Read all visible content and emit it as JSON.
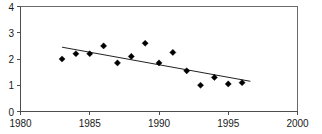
{
  "chart_data": {
    "type": "scatter",
    "title": "",
    "subtitle": "",
    "xlabel": "",
    "ylabel": "",
    "xlim": [
      1980,
      2000
    ],
    "ylim": [
      0,
      4
    ],
    "grid": false,
    "legend": null,
    "x_ticks": [
      1980,
      1985,
      1990,
      1995,
      2000
    ],
    "x_tick_labels": [
      "1980",
      "1985",
      "1990",
      "1995",
      "2000"
    ],
    "y_ticks": [
      0,
      1,
      2,
      3,
      4
    ],
    "y_tick_labels": [
      "0",
      "1",
      "2",
      "3",
      "4"
    ],
    "marker": "diamond",
    "marker_color": "#000000",
    "series": [
      {
        "name": "observations",
        "x": [
          1983,
          1984,
          1985,
          1986,
          1987,
          1988,
          1989,
          1990,
          1991,
          1992,
          1993,
          1994,
          1995,
          1996
        ],
        "values": [
          2.0,
          2.2,
          2.2,
          2.5,
          1.85,
          2.1,
          2.6,
          1.85,
          2.25,
          1.55,
          1.0,
          1.3,
          1.05,
          1.1
        ]
      },
      {
        "name": "trend-line",
        "type": "line",
        "x": [
          1983.0,
          1996.6
        ],
        "values": [
          2.45,
          1.15
        ],
        "color": "#222222"
      }
    ]
  },
  "axes": {
    "y_axis_name": "y-axis",
    "x_axis_name": "x-axis"
  }
}
